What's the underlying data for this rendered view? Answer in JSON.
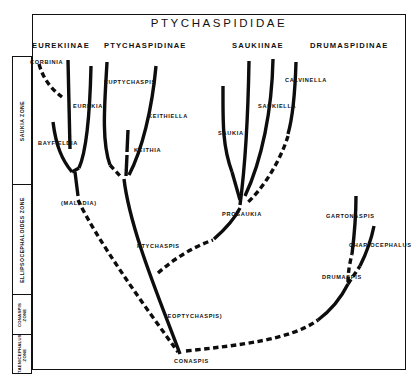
{
  "figure": {
    "title": "PTYCHASPIDIDAE"
  },
  "subfamilies": [
    {
      "label": "EUREKIINAE",
      "x": 32,
      "y": 41
    },
    {
      "label": "PTYCHASPIDINAE",
      "x": 104,
      "y": 41
    },
    {
      "label": "SAUKIINAE",
      "x": 232,
      "y": 41
    },
    {
      "label": "DRUMASPIDINAE",
      "x": 310,
      "y": 41
    }
  ],
  "zones": [
    {
      "label": "SAUKIA  ZONE",
      "top": 0,
      "height": 128,
      "small": false
    },
    {
      "label": "ELLIPSOCEPHALOIDES  ZONE",
      "top": 128,
      "height": 110,
      "small": false
    },
    {
      "label": "CONASPIS ZONE",
      "top": 238,
      "height": 40,
      "small": true
    },
    {
      "label": "TAENICEPHALUS ZONE",
      "top": 278,
      "height": 40,
      "small": true
    }
  ],
  "genera": [
    {
      "name": "CORBINIA",
      "x": 30,
      "y": 59
    },
    {
      "name": "EUREKIA",
      "x": 73,
      "y": 103
    },
    {
      "name": "BAYFIELDIA",
      "x": 38,
      "y": 140
    },
    {
      "name": "(MALADIA)",
      "x": 61,
      "y": 200
    },
    {
      "name": "EUPTYCHASPIS",
      "x": 104,
      "y": 79
    },
    {
      "name": "KEITHIELLA",
      "x": 148,
      "y": 113
    },
    {
      "name": "KEITHIA",
      "x": 134,
      "y": 147
    },
    {
      "name": "PTYCHASPIS",
      "x": 137,
      "y": 243
    },
    {
      "name": "(EOPTYCHASPIS)",
      "x": 165,
      "y": 313
    },
    {
      "name": "CONASPIS",
      "x": 174,
      "y": 358
    },
    {
      "name": "SAUKIA",
      "x": 218,
      "y": 130
    },
    {
      "name": "SAUKIELLA",
      "x": 258,
      "y": 103
    },
    {
      "name": "CALVINELLA",
      "x": 285,
      "y": 77
    },
    {
      "name": "PROSAUKIA",
      "x": 222,
      "y": 211
    },
    {
      "name": "GARTONASPIS",
      "x": 326,
      "y": 213
    },
    {
      "name": "CHARIOCEPHALUS",
      "x": 349,
      "y": 242
    },
    {
      "name": "DRUMASPIS",
      "x": 322,
      "y": 274
    }
  ],
  "lineages": {
    "solid_color": "#0d0d0d",
    "dashed_color": "#0d0d0d",
    "branches": [
      {
        "id": "corbinia-stem",
        "style": "dashed",
        "d": "M 39,64 C 43,78 50,88 62,97"
      },
      {
        "id": "eurekia-vert",
        "style": "solid",
        "d": "M 68,60 L 70,149"
      },
      {
        "id": "eurekiinae-right",
        "style": "solid",
        "d": "M 91,66 C 90,110 87,150 79,168"
      },
      {
        "id": "bayfieldia-left",
        "style": "solid",
        "d": "M 53,122 C 56,146 62,160 72,172"
      },
      {
        "id": "eurekia-join",
        "style": "solid",
        "d": "M 72,172 L 79,168"
      },
      {
        "id": "maladia-stem",
        "style": "solid",
        "d": "M 75,172 L 78,196"
      },
      {
        "id": "maladia-to-base",
        "style": "dashed",
        "d": "M 78,200 C 96,238 140,300 178,352"
      },
      {
        "id": "euptychaspis-vert",
        "style": "solid",
        "d": "M 107,62 C 105,100 101,140 110,165"
      },
      {
        "id": "euptychaspis-join",
        "style": "dashed",
        "d": "M 110,165 L 121,177"
      },
      {
        "id": "keithia-vert",
        "style": "solid",
        "d": "M 128,130 L 127,152"
      },
      {
        "id": "keithia-join",
        "style": "solid",
        "d": "M 127,155 L 126,176"
      },
      {
        "id": "keithiella-vert",
        "style": "solid",
        "d": "M 156,66 C 152,110 142,150 129,175"
      },
      {
        "id": "ptychaspis-stem",
        "style": "solid",
        "d": "M 124,179 C 130,230 160,300 180,354"
      },
      {
        "id": "ptychaspis-branch",
        "style": "dashed",
        "d": "M 158,273 C 175,258 193,247 213,240"
      },
      {
        "id": "saukia-vert",
        "style": "solid",
        "d": "M 223,86 C 223,120 222,145 232,172"
      },
      {
        "id": "prosaukia-vert",
        "style": "solid",
        "d": "M 249,61 C 248,120 244,175 240,205"
      },
      {
        "id": "saukiella-vert",
        "style": "solid",
        "d": "M 273,59 C 272,110 262,160 245,196"
      },
      {
        "id": "calvinella-vert",
        "style": "solid",
        "d": "M 296,62 C 295,95 292,120 288,134"
      },
      {
        "id": "calvinella-dash",
        "style": "dashed",
        "d": "M 288,136 C 280,162 262,190 246,204"
      },
      {
        "id": "saukia-join",
        "style": "solid",
        "d": "M 232,172 L 240,200"
      },
      {
        "id": "prosaukia-down",
        "style": "solid",
        "d": "M 240,208 C 233,222 222,232 214,239"
      },
      {
        "id": "conaspis-right",
        "style": "dashed",
        "d": "M 186,351 C 240,345 290,340 318,320"
      },
      {
        "id": "drumaspis-stem",
        "style": "solid",
        "d": "M 318,320 C 334,308 342,296 348,284"
      },
      {
        "id": "drumaspis-dash",
        "style": "dashed",
        "d": "M 348,284 C 352,278 356,272 360,266"
      },
      {
        "id": "chariocephalus",
        "style": "solid",
        "d": "M 374,226 C 370,246 364,258 360,266"
      },
      {
        "id": "gartonaspis-dash",
        "style": "dashed",
        "d": "M 348,282 C 348,272 350,262 352,254"
      },
      {
        "id": "gartonaspis-vert",
        "style": "solid",
        "d": "M 352,254 C 354,238 356,220 356,196"
      }
    ]
  }
}
